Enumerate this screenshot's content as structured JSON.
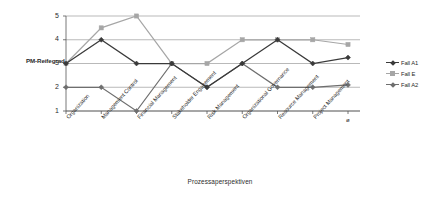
{
  "chart_data": {
    "type": "line",
    "title": "",
    "xlabel": "Prozessaperspektiven",
    "ylabel": "PM-Reifegrad",
    "ylim": [
      1,
      5
    ],
    "yticks": [
      1,
      2,
      3,
      4,
      5
    ],
    "grid": true,
    "legend_position": "right",
    "categories": [
      "Organization",
      "Management Control",
      "Financial Management",
      "Stakeholder Engagement",
      "Risk Management",
      "Organizational Governance",
      "Resource Management",
      "Project Management",
      "ø"
    ],
    "series": [
      {
        "name": "Fall A1",
        "color": "#3a3a3a",
        "marker": "diamond",
        "values": [
          3,
          4,
          3,
          3,
          2,
          3,
          4,
          3,
          3.25
        ]
      },
      {
        "name": "Fall E",
        "color": "#a6a6a6",
        "marker": "square",
        "values": [
          3,
          4.5,
          5,
          3,
          3,
          4,
          4,
          4,
          3.8
        ]
      },
      {
        "name": "Fall A2",
        "color": "#6e6e6e",
        "marker": "diamond",
        "values": [
          2,
          2,
          1,
          3,
          2,
          3,
          2,
          2,
          2.1
        ]
      }
    ]
  },
  "axis": {
    "y_title": "PM-Reifegrad",
    "x_title": "Prozessaperspektiven",
    "y_labels": [
      "5",
      "4",
      "3",
      "2",
      "1"
    ]
  },
  "legend": {
    "items": [
      {
        "label": "Fall A1"
      },
      {
        "label": "Fall E"
      },
      {
        "label": "Fall A2"
      }
    ]
  }
}
